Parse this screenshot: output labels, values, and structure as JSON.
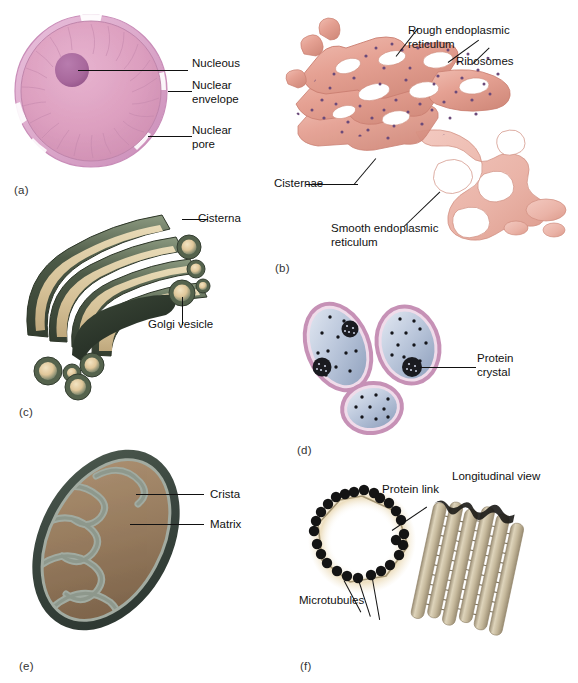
{
  "figure": {
    "background": "#ffffff",
    "text_color": "#111111",
    "leader_color": "#111111"
  },
  "panels": [
    {
      "id": "a",
      "panel_label": "(a)",
      "subject": "nucleus",
      "colors": {
        "envelope": "#d9a8c8",
        "nucleoplasm": "#dda0c0",
        "nucleolus": "#a8689c",
        "outline": "#b97fae"
      },
      "labels": [
        {
          "key": "nucleolus",
          "text": "Nucleous"
        },
        {
          "key": "envelope",
          "text": "Nuclear\nenvelope"
        },
        {
          "key": "pore",
          "text": "Nuclear\npore"
        }
      ]
    },
    {
      "id": "b",
      "panel_label": "(b)",
      "subject": "endoplasmic-reticulum",
      "colors": {
        "membrane": "#e6a396",
        "membrane_light": "#f2c4ba",
        "membrane_dark": "#cf8476",
        "ribosome": "#6b4a7a"
      },
      "labels": [
        {
          "key": "rough_er",
          "text": "Rough endoplasmic\nreticulum"
        },
        {
          "key": "ribosomes",
          "text": "Ribosomes"
        },
        {
          "key": "cisternae",
          "text": "Cisternae"
        },
        {
          "key": "smooth_er",
          "text": "Smooth endoplasmic\nreticulum"
        }
      ]
    },
    {
      "id": "c",
      "panel_label": "(c)",
      "subject": "golgi-apparatus",
      "colors": {
        "membrane_dark": "#3e4a3c",
        "membrane_mid": "#7b8a70",
        "lumen": "#e7d2a8",
        "core": "#2e3a2c"
      },
      "labels": [
        {
          "key": "cisterna",
          "text": "Cisterna"
        },
        {
          "key": "vesicle",
          "text": "Golgi vesicle"
        }
      ]
    },
    {
      "id": "d",
      "panel_label": "(d)",
      "subject": "peroxisomes",
      "colors": {
        "membrane": "#c691b6",
        "matrix_light": "#ccd6e6",
        "matrix_dark": "#9aaac4",
        "granule": "#15161b"
      },
      "labels": [
        {
          "key": "protein_crystal",
          "text": "Protein\ncrystal"
        }
      ]
    },
    {
      "id": "e",
      "panel_label": "(e)",
      "subject": "mitochondrion",
      "colors": {
        "outer_membrane": "#3b4740",
        "inner_membrane": "#9aa39a",
        "matrix": "#9a7f62",
        "matrix_dark": "#7d6348"
      },
      "labels": [
        {
          "key": "crista",
          "text": "Crista"
        },
        {
          "key": "matrix",
          "text": "Matrix"
        }
      ]
    },
    {
      "id": "f",
      "panel_label": "(f)",
      "subject": "centriole",
      "colors": {
        "tubule": "#141414",
        "halo": "#e8d9b8",
        "cylinder": "#c9bda0",
        "cylinder_dark": "#a2957a",
        "cylinder_light": "#e4dbc6"
      },
      "labels": [
        {
          "key": "protein_link",
          "text": "Protein link"
        },
        {
          "key": "microtubules",
          "text": "Microtubules"
        },
        {
          "key": "longitudinal",
          "text": "Longitudinal view"
        }
      ]
    }
  ]
}
